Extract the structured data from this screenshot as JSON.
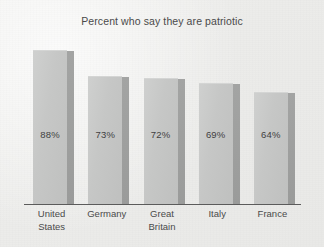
{
  "chart_data": {
    "type": "bar",
    "title": "Percent who say they are patriotic",
    "xlabel": "",
    "ylabel": "",
    "ylim": [
      0,
      100
    ],
    "grid": false,
    "legend": "none",
    "value_suffix": "%",
    "categories": [
      "United States",
      "Germany",
      "Great Britain",
      "Italy",
      "France"
    ],
    "category_lines": [
      [
        "United",
        "States"
      ],
      [
        "Germany",
        ""
      ],
      [
        "Great",
        "Britain"
      ],
      [
        "Italy",
        ""
      ],
      [
        "France",
        ""
      ]
    ],
    "values": [
      88,
      73,
      72,
      69,
      64
    ],
    "value_labels": [
      "88%",
      "73%",
      "72%",
      "69%",
      "64%"
    ],
    "series": [
      {
        "name": "Percent patriotic",
        "values": [
          88,
          73,
          72,
          69,
          64
        ]
      }
    ]
  },
  "style": {
    "background_color": "#efefed",
    "bar_face_color": "#c6c7c6",
    "bar_side_color": "#9b9c9b",
    "axis_color": "#5b5b5b",
    "text_color": "#4a4a4a"
  }
}
